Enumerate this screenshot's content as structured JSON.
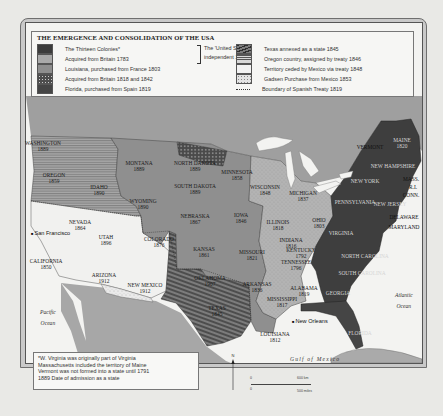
{
  "title": "THE EMERGENCE AND CONSOLIDATION OF THE USA",
  "legend": {
    "left_column": [
      {
        "label": "The Thirteen Colonies*",
        "pattern": "solid-darkest",
        "color": "#3c3c3c"
      },
      {
        "label": "Acquired from Britain 1783",
        "pattern": "light-stippled",
        "color": "#a9a9a9"
      },
      {
        "label": "Louisiana, purchased from France 1803",
        "pattern": "solid-mid",
        "color": "#8e8e8e"
      },
      {
        "label": "Acquired from Britain 1818 and 1842",
        "pattern": "dark-dotted",
        "color": "#4d4d4d"
      },
      {
        "label": "Florida, purchased from Spain 1819",
        "pattern": "solid-dark",
        "color": "#454545"
      }
    ],
    "bracket_text": [
      "The 'United States'",
      "independent 1783"
    ],
    "right_column": [
      {
        "label": "Texas annexed as a state 1845",
        "pattern": "dark-diagonal-hatch",
        "color": "#5a5a5a"
      },
      {
        "label": "Oregon country, assigned by treaty 1846",
        "pattern": "horizontal-lines",
        "color": "#9a9a9a"
      },
      {
        "label": "Territory ceded by Mexico via treaty 1848",
        "pattern": "white",
        "color": "#f2f2f2"
      },
      {
        "label": "Gadsen Purchase from Mexico 1853",
        "pattern": "white-speckled",
        "color": "#e4e4e4"
      },
      {
        "label": "Boundary of Spanish Treaty 1819",
        "pattern": "dotted-line",
        "color": "#333333"
      }
    ]
  },
  "states": [
    {
      "name": "WASHINGTON",
      "year": "1889",
      "x": 43,
      "y": 140
    },
    {
      "name": "OREGON",
      "year": "1859",
      "x": 54,
      "y": 172
    },
    {
      "name": "IDAHO",
      "year": "1890",
      "x": 99,
      "y": 184
    },
    {
      "name": "MONTANA",
      "year": "1889",
      "x": 139,
      "y": 160
    },
    {
      "name": "NORTH DAKOTA",
      "year": "1889",
      "x": 195,
      "y": 160
    },
    {
      "name": "SOUTH DAKOTA",
      "year": "1889",
      "x": 195,
      "y": 183
    },
    {
      "name": "WYOMING",
      "year": "1890",
      "x": 143,
      "y": 198
    },
    {
      "name": "MINNESOTA",
      "year": "1858",
      "x": 237,
      "y": 169
    },
    {
      "name": "WISCONSIN",
      "year": "1848",
      "x": 265,
      "y": 184
    },
    {
      "name": "MICHIGAN",
      "year": "1837",
      "x": 303,
      "y": 190
    },
    {
      "name": "NEBRASKA",
      "year": "1867",
      "x": 195,
      "y": 213
    },
    {
      "name": "IOWA",
      "year": "1846",
      "x": 241,
      "y": 212
    },
    {
      "name": "ILLINOIS",
      "year": "1818",
      "x": 278,
      "y": 219
    },
    {
      "name": "INDIANA",
      "year": "1816",
      "x": 291,
      "y": 237
    },
    {
      "name": "OHIO",
      "year": "1803",
      "x": 319,
      "y": 217
    },
    {
      "name": "NEVADA",
      "year": "1864",
      "x": 80,
      "y": 219
    },
    {
      "name": "UTAH",
      "year": "1896",
      "x": 106,
      "y": 234
    },
    {
      "name": "COLORADO",
      "year": "1876",
      "x": 159,
      "y": 236
    },
    {
      "name": "KANSAS",
      "year": "1861",
      "x": 204,
      "y": 246
    },
    {
      "name": "MISSOURI",
      "year": "1821",
      "x": 252,
      "y": 249
    },
    {
      "name": "KENTUCKY",
      "year": "1792",
      "x": 301,
      "y": 247
    },
    {
      "name": "VIRGINIA",
      "year": "",
      "x": 341,
      "y": 230
    },
    {
      "name": "CALIFORNIA",
      "year": "1850",
      "x": 46,
      "y": 258
    },
    {
      "name": "ARIZONA",
      "year": "1912",
      "x": 104,
      "y": 272
    },
    {
      "name": "NEW MEXICO",
      "year": "1912",
      "x": 145,
      "y": 282
    },
    {
      "name": "OKLAHOMA",
      "year": "1907",
      "x": 210,
      "y": 275
    },
    {
      "name": "ARKANSAS",
      "year": "1836",
      "x": 257,
      "y": 281
    },
    {
      "name": "TENNESSEE",
      "year": "1796",
      "x": 296,
      "y": 259
    },
    {
      "name": "NORTH CAROLINA",
      "year": "",
      "x": 365,
      "y": 253
    },
    {
      "name": "SOUTH CAROLINA",
      "year": "",
      "x": 362,
      "y": 270
    },
    {
      "name": "MISSISSIPPI",
      "year": "1817",
      "x": 282,
      "y": 296
    },
    {
      "name": "ALABAMA",
      "year": "1819",
      "x": 304,
      "y": 285
    },
    {
      "name": "GEORGIA",
      "year": "",
      "x": 338,
      "y": 290
    },
    {
      "name": "TEXAS",
      "year": "1845",
      "x": 217,
      "y": 305
    },
    {
      "name": "LOUISIANA",
      "year": "1812",
      "x": 275,
      "y": 331
    },
    {
      "name": "FLORIDA",
      "year": "",
      "x": 360,
      "y": 330
    },
    {
      "name": "VERMONT",
      "year": "",
      "x": 370,
      "y": 144
    },
    {
      "name": "MAINE",
      "year": "1820",
      "x": 402,
      "y": 137
    },
    {
      "name": "NEW HAMPSHIRE",
      "year": "",
      "x": 393,
      "y": 163
    },
    {
      "name": "NEW YORK",
      "year": "",
      "x": 365,
      "y": 178
    },
    {
      "name": "MASS.",
      "year": "",
      "x": 411,
      "y": 176
    },
    {
      "name": "R.I.",
      "year": "",
      "x": 413,
      "y": 184
    },
    {
      "name": "CONN.",
      "year": "",
      "x": 411,
      "y": 192
    },
    {
      "name": "PENNSYLVANIA",
      "year": "",
      "x": 355,
      "y": 199
    },
    {
      "name": "NEW JERSEY",
      "year": "",
      "x": 390,
      "y": 201
    },
    {
      "name": "DELAWARE",
      "year": "",
      "x": 404,
      "y": 214
    },
    {
      "name": "MARYLAND",
      "year": "",
      "x": 404,
      "y": 224
    }
  ],
  "cities": [
    {
      "name": "San Francisco",
      "x": 31,
      "y": 230
    },
    {
      "name": "New Orleans",
      "x": 292,
      "y": 318
    }
  ],
  "oceans": [
    {
      "name": "Pacific Ocean",
      "lines": [
        "Pacific",
        "Ocean"
      ],
      "x": 40,
      "y": 309
    },
    {
      "name": "Atlantic Ocean",
      "lines": [
        "Atlantic",
        "Ocean"
      ],
      "x": 395,
      "y": 292
    },
    {
      "name": "Gulf of Mexico",
      "lines": [
        "Gulf of Mexico"
      ],
      "x": 290,
      "y": 356
    }
  ],
  "footnote": {
    "lines": [
      "*W. Virginia was originally part of Virginia",
      "Massachusetts included the territory of Maine",
      "Vermont was not formed into a state until 1791",
      "1889 Date of admission as a state"
    ]
  },
  "scale": {
    "top_label": "600 km",
    "bottom_label": "500 miles",
    "zero": "0"
  },
  "north_arrow": {
    "label": "N"
  }
}
